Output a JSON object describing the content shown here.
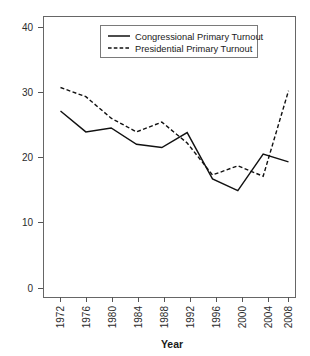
{
  "chart_data": {
    "type": "line",
    "title": "",
    "subtitle": "",
    "xlabel": "Year",
    "ylabel": "",
    "x": [
      1972,
      1976,
      1980,
      1984,
      1988,
      1992,
      1996,
      2000,
      2004,
      2008
    ],
    "categories": [
      "1972",
      "1976",
      "1980",
      "1984",
      "1988",
      "1992",
      "1996",
      "2000",
      "2004",
      "2008"
    ],
    "series": [
      {
        "name": "Congressional Primary Turnout",
        "style": "solid",
        "color": "#111111",
        "values": [
          27.2,
          24.0,
          24.6,
          22.1,
          21.6,
          23.9,
          16.8,
          15.0,
          20.6,
          19.4
        ]
      },
      {
        "name": "Presidential Primary Turnout",
        "style": "dashed",
        "color": "#111111",
        "values": [
          30.8,
          29.4,
          26.1,
          24.0,
          25.5,
          22.3,
          17.4,
          18.8,
          17.2,
          30.3
        ]
      }
    ],
    "xlim": [
      1970,
      2010
    ],
    "ylim": [
      -1.5,
      42.0
    ],
    "yticks": [
      0,
      10,
      20,
      30,
      40
    ],
    "yticklabels": [
      "0",
      "10",
      "20",
      "30",
      "40"
    ],
    "xticklabels": [
      "1972",
      "1976",
      "1980",
      "1984",
      "1988",
      "1992",
      "1996",
      "2000",
      "2004",
      "2008"
    ],
    "xtick_rotation": 90,
    "grid": false,
    "legend": {
      "position": "top-center",
      "entries": [
        {
          "label": "Congressional Primary Turnout",
          "style": "solid"
        },
        {
          "label": "Presidential Primary Turnout",
          "style": "dashed"
        }
      ]
    }
  },
  "axis": {
    "x_title": "Year",
    "y_tick_0": "0",
    "y_tick_10": "10",
    "y_tick_20": "20",
    "y_tick_30": "30",
    "y_tick_40": "40",
    "x_tick_1972": "1972",
    "x_tick_1976": "1976",
    "x_tick_1980": "1980",
    "x_tick_1984": "1984",
    "x_tick_1988": "1988",
    "x_tick_1992": "1992",
    "x_tick_1996": "1996",
    "x_tick_2000": "2000",
    "x_tick_2004": "2004",
    "x_tick_2008": "2008"
  },
  "legend": {
    "entry_1_label": "Congressional Primary Turnout",
    "entry_2_label": "Presidential Primary Turnout"
  }
}
